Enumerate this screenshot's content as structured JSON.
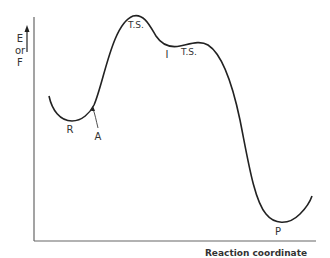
{
  "diagram": {
    "y_axis_label_lines": [
      "E",
      "or",
      "F"
    ],
    "x_axis_label": "Reaction coordinate",
    "points": {
      "reactant": "R",
      "point_a": "A",
      "transition_state_1": "T.S.",
      "intermediate": "I",
      "transition_state_2": "T.S.",
      "product": "P"
    },
    "colors": {
      "line": "#222222",
      "axis": "#555555",
      "text": "#333333"
    }
  }
}
